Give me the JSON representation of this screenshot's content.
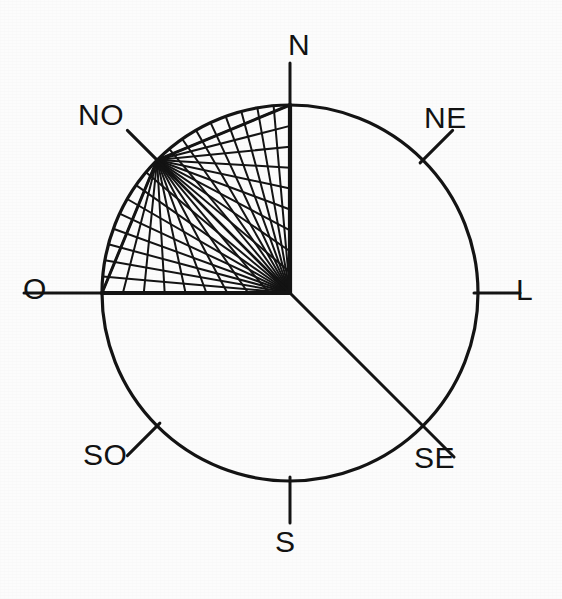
{
  "figure": {
    "kind": "compass-rose-radiation-diagram",
    "background_color": "#fcfcfc",
    "ink_color": "#141414"
  },
  "chart_data": {
    "type": "scatter",
    "title": "",
    "subtitle": "",
    "xlabel": "",
    "ylabel": "",
    "geometry": {
      "center_x": 290,
      "center_y": 293,
      "radius": 188,
      "fan_origin_a": "center",
      "fan_origin_b": "NO",
      "fan_sector_start_deg": 90,
      "fan_sector_end_deg": 180,
      "rays_per_fan": 19
    },
    "axis_ranges": {
      "angle_deg": [
        0,
        360
      ]
    },
    "grid": true,
    "legend": "none",
    "labels": [
      {
        "id": "N",
        "text": "N",
        "angle_deg": 90,
        "tick": "external-short",
        "x": 288,
        "y": 30
      },
      {
        "id": "NE",
        "text": "NE",
        "angle_deg": 45,
        "tick": "external-short",
        "x": 424,
        "y": 103
      },
      {
        "id": "L",
        "text": "L",
        "angle_deg": 0,
        "tick": "external-short",
        "x": 516,
        "y": 275
      },
      {
        "id": "SE",
        "text": "SE",
        "angle_deg": 315,
        "tick": "full-radius",
        "x": 414,
        "y": 443
      },
      {
        "id": "S",
        "text": "S",
        "angle_deg": 270,
        "tick": "external-short",
        "x": 275,
        "y": 527
      },
      {
        "id": "SO",
        "text": "SO",
        "angle_deg": 225,
        "tick": "external-short",
        "x": 83,
        "y": 440
      },
      {
        "id": "O",
        "text": "O",
        "angle_deg": 180,
        "tick": "external-long",
        "x": 23,
        "y": 274
      },
      {
        "id": "NO",
        "text": "NO",
        "angle_deg": 135,
        "tick": "external-short",
        "x": 78,
        "y": 100
      }
    ],
    "series": [
      {
        "name": "centre-fan",
        "origin": "center",
        "angles_deg": [
          90,
          95,
          100,
          105,
          110,
          115,
          120,
          125,
          130,
          135,
          140,
          145,
          150,
          155,
          160,
          165,
          170,
          175,
          180
        ]
      },
      {
        "name": "northwest-fan",
        "origin": "NO",
        "angles_deg": [
          90,
          95,
          100,
          105,
          110,
          115,
          120,
          125,
          130,
          135,
          140,
          145,
          150,
          155,
          160,
          165,
          170,
          175,
          180
        ]
      }
    ]
  }
}
